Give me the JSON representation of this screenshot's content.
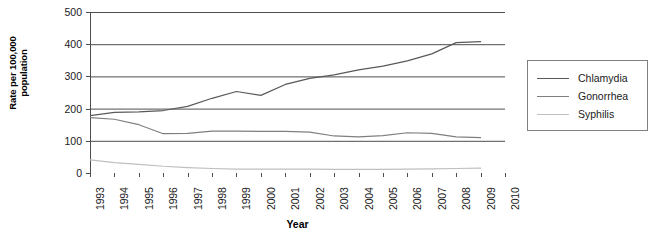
{
  "chart_data": {
    "type": "line",
    "title": "",
    "xlabel": "Year",
    "ylabel": "Rate per 100,000 population",
    "ylabel_line1": "Rate per 100,000",
    "ylabel_line2": "population",
    "xlim": [
      1993,
      2010
    ],
    "ylim": [
      0,
      500
    ],
    "yticks": [
      0,
      100,
      200,
      300,
      400,
      500
    ],
    "grid": "horizontal",
    "legend_position": "right",
    "categories": [
      1993,
      1994,
      1995,
      1996,
      1997,
      1998,
      1999,
      2000,
      2001,
      2002,
      2003,
      2004,
      2005,
      2006,
      2007,
      2008,
      2009,
      2010
    ],
    "x": [
      "1993",
      "1994",
      "1995",
      "1996",
      "1997",
      "1998",
      "1999",
      "2000",
      "2001",
      "2002",
      "2003",
      "2004",
      "2005",
      "2006",
      "2007",
      "2008",
      "2009",
      "2010"
    ],
    "series": [
      {
        "name": "Chlamydia",
        "color": "#595959",
        "values": [
          178,
          188,
          190,
          194,
          207,
          232,
          253,
          241,
          275,
          294,
          305,
          320,
          332,
          348,
          370,
          405,
          408,
          null
        ]
      },
      {
        "name": "Gonorrhea",
        "color": "#7f7f7f",
        "values": [
          172,
          167,
          150,
          122,
          123,
          130,
          130,
          129,
          129,
          127,
          115,
          112,
          116,
          125,
          123,
          112,
          110,
          null
        ]
      },
      {
        "name": "Syphilis",
        "color": "#bfbfbf",
        "values": [
          41,
          32,
          27,
          21,
          17,
          14,
          12,
          12,
          12,
          12,
          11,
          11,
          11,
          12,
          13,
          14,
          15,
          null
        ]
      }
    ],
    "legend": [
      {
        "label": "Chlamydia",
        "color": "#595959"
      },
      {
        "label": "Gonorrhea",
        "color": "#7f7f7f"
      },
      {
        "label": "Syphilis",
        "color": "#bfbfbf"
      }
    ],
    "axis_color": "#4d4d4d",
    "grid_color": "#4d4d4d"
  }
}
